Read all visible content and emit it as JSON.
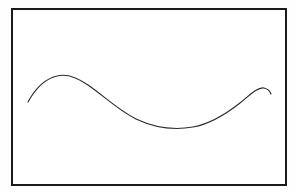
{
  "figure": {
    "title": "",
    "background_color": "#ffffff",
    "canvas_color": "#fefefe",
    "width": 298,
    "height": 194
  },
  "frame": {
    "name": "rectangular-border",
    "stroke_color": "#1a1a1a",
    "stroke_width": 2,
    "left": 11,
    "top": 8,
    "width": 276,
    "height": 178
  },
  "chart_data": {
    "type": "line",
    "title": "",
    "xlabel": "",
    "ylabel": "",
    "grid": false,
    "legend": null,
    "axis_ticks": [],
    "tick_labels": [],
    "annotations": [],
    "xlim": [
      11,
      287
    ],
    "ylim": [
      186,
      8
    ],
    "series": [
      {
        "name": "freehand-wave",
        "color": "#2b2b2b",
        "stroke_width": 1.15,
        "style": "smooth-open-curve",
        "x": [
          28,
          36,
          45,
          55,
          65,
          76,
          88,
          100,
          112,
          125,
          138,
          150,
          162,
          173,
          183,
          192,
          202,
          212,
          222,
          232,
          242,
          251,
          258,
          263,
          267,
          271
        ],
        "y": [
          102,
          93,
          86,
          80,
          77,
          75,
          77,
          81,
          87,
          94,
          101,
          108,
          114,
          119,
          123,
          126,
          127,
          125,
          121,
          115,
          108,
          99,
          92,
          88,
          89,
          94
        ],
        "path": "M 28 102 C 34 91, 44 79, 57 76 C 68 73, 78 78, 88 85 C 104 96, 118 110, 136 119 C 155 128, 176 130, 193 127 C 210 124, 226 114, 240 103 C 251 94, 258 87, 264 88 C 268 89, 270 91, 271 94"
      }
    ]
  },
  "labels": {
    "curve_name": "sinusoidal-curve",
    "frame_name": "diagram-frame"
  }
}
